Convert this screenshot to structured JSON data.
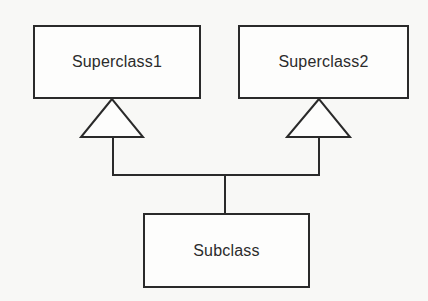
{
  "diagram": {
    "type": "uml-class-inheritance",
    "colors": {
      "stroke": "#2a2a2a",
      "text": "#2b2b2b",
      "background": "#f8f8f6",
      "box_fill": "#fdfdfc"
    },
    "classes": [
      {
        "id": "superclass1",
        "label": "Superclass1",
        "x": 33,
        "y": 25,
        "w": 168,
        "h": 74
      },
      {
        "id": "superclass2",
        "label": "Superclass2",
        "x": 238,
        "y": 25,
        "w": 171,
        "h": 74
      },
      {
        "id": "subclass",
        "label": "Subclass",
        "x": 143,
        "y": 213,
        "w": 167,
        "h": 75
      }
    ],
    "relationships": [
      {
        "type": "generalization",
        "from": "Subclass",
        "to": "Superclass1"
      },
      {
        "type": "generalization",
        "from": "Subclass",
        "to": "Superclass2"
      }
    ]
  }
}
